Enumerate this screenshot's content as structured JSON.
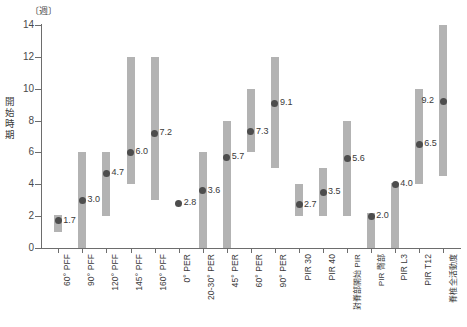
{
  "chart_data": {
    "type": "bar",
    "title": "",
    "subtitle": "",
    "unit_label": "〔週〕",
    "ylabel": "開始時期",
    "xlabel": "",
    "ylim": [
      0,
      14
    ],
    "ytick_values": [
      0,
      2,
      4,
      6,
      8,
      10,
      12,
      14
    ],
    "ytick_labels": [
      "0",
      "2",
      "4",
      "6",
      "8",
      "10",
      "12",
      "14"
    ],
    "grid": false,
    "legend": "none",
    "series_note": "Each category shows a shaded range bar (min-max) with a dark dot marking the mean value, labelled numerically.",
    "categories": [
      "60° PFF",
      "90° PFF",
      "120° PFF",
      "145° PFF",
      "160° PFF",
      "0° PER",
      "20-30° PER",
      "45° PER",
      "60° PER",
      "90° PER",
      "PIR 30",
      "PIR 40",
      "對脊部開始 PIR",
      "PIR 臀部",
      "PIR L3",
      "PIR T12",
      "脊椎全活動度"
    ],
    "values": [
      1.7,
      3.0,
      4.7,
      6.0,
      7.2,
      2.8,
      3.6,
      5.7,
      7.3,
      9.1,
      2.7,
      3.5,
      5.6,
      2.0,
      4.0,
      6.5,
      9.2
    ],
    "value_labels": [
      "1.7",
      "3.0",
      "4.7",
      "6.0",
      "7.2",
      "2.8",
      "3.6",
      "5.7",
      "7.3",
      "9.1",
      "2.7",
      "3.5",
      "5.6",
      "2.0",
      "4.0",
      "6.5",
      "9.2"
    ],
    "ranges": [
      [
        1.0,
        2.1
      ],
      [
        0.0,
        6.0
      ],
      [
        2.0,
        6.0
      ],
      [
        4.0,
        12.0
      ],
      [
        3.0,
        12.0
      ],
      [
        null,
        null
      ],
      [
        0.0,
        6.0
      ],
      [
        0.0,
        8.0
      ],
      [
        6.0,
        10.0
      ],
      [
        5.0,
        12.0
      ],
      [
        2.0,
        4.0
      ],
      [
        2.0,
        5.0
      ],
      [
        2.0,
        8.0
      ],
      [
        0.0,
        2.2
      ],
      [
        0.0,
        4.1
      ],
      [
        4.0,
        10.0
      ],
      [
        4.5,
        14.0
      ]
    ],
    "colors": {
      "bar": "#b3b3b3",
      "dot": "#4d4d4d",
      "axis": "#6d6d6d",
      "text": "#3a3a3a",
      "background": "#ffffff"
    }
  }
}
